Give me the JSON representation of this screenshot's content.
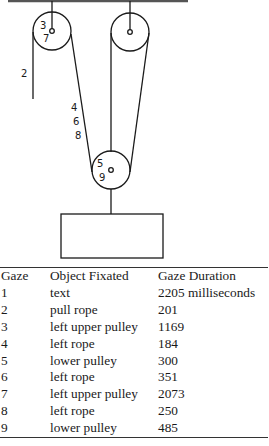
{
  "figure": {
    "diagram": {
      "description": "pulley system with two upper pulleys, a lower pulley and a hanging weight",
      "labels": [
        {
          "text": "3",
          "x": 40,
          "y": 29
        },
        {
          "text": "7",
          "x": 43,
          "y": 42
        },
        {
          "text": "2",
          "x": 21,
          "y": 77
        },
        {
          "text": "4",
          "x": 71,
          "y": 111
        },
        {
          "text": "6",
          "x": 73,
          "y": 125
        },
        {
          "text": "8",
          "x": 75,
          "y": 139
        },
        {
          "text": "5",
          "x": 97,
          "y": 167
        },
        {
          "text": "9",
          "x": 99,
          "y": 181
        }
      ]
    },
    "table": {
      "headers": [
        "Gaze",
        "Object Fixated",
        "Gaze Duration"
      ],
      "rows": [
        [
          "1",
          "text",
          "2205 milliseconds"
        ],
        [
          "2",
          "pull rope",
          "201"
        ],
        [
          "3",
          "left upper pulley",
          "1169"
        ],
        [
          "4",
          "left rope",
          "184"
        ],
        [
          "5",
          "lower pulley",
          "300"
        ],
        [
          "6",
          "left rope",
          "351"
        ],
        [
          "7",
          "left upper pulley",
          "2073"
        ],
        [
          "8",
          "left rope",
          "250"
        ],
        [
          "9",
          "lower pulley",
          "485"
        ]
      ]
    }
  }
}
